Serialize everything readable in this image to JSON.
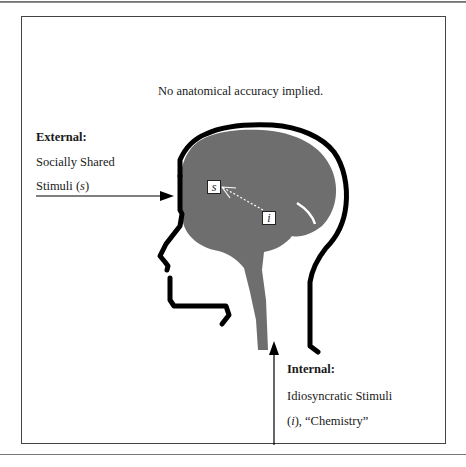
{
  "note": "No anatomical accuracy implied.",
  "external": {
    "heading": "External:",
    "line1": "Socially Shared",
    "line2_prefix": "Stimuli (",
    "line2_var": "s",
    "line2_suffix": ")"
  },
  "internal": {
    "heading": "Internal:",
    "line1": "Idiosyncratic Stimuli",
    "line2_prefix": "(",
    "line2_var": "i",
    "line2_suffix": "), “Chemistry”"
  },
  "markers": {
    "s": "s",
    "i": "i"
  },
  "colors": {
    "outline": "#000000",
    "brain": "#6e6e6e",
    "frame": "#444444"
  }
}
